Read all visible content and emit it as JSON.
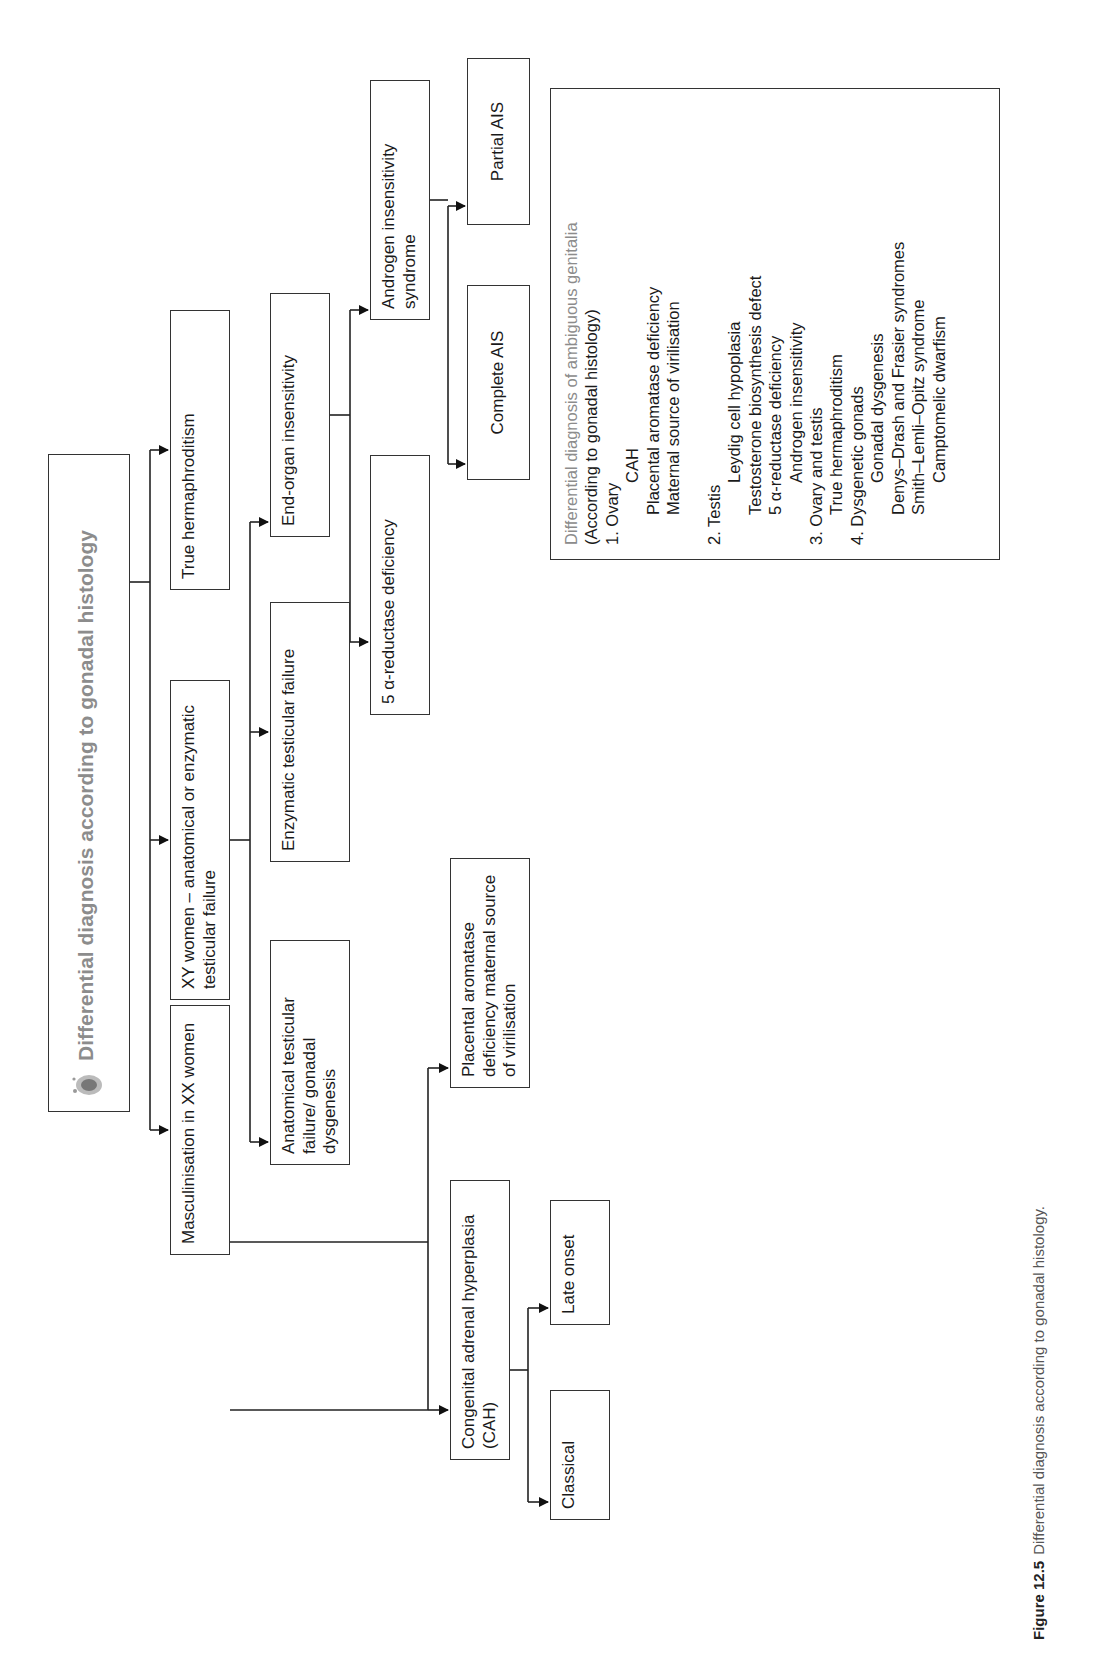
{
  "diagram": {
    "root": {
      "title": "Differential diagnosis according to gonadal histology",
      "icon": "fetus-icon"
    },
    "level1": [
      {
        "id": "masc-xx",
        "label": "Masculinisation in XX women"
      },
      {
        "id": "xy-women",
        "label": "XY women – anatomical or enzymatic testicular failure"
      },
      {
        "id": "true-herm",
        "label": "True hermaphroditism"
      }
    ],
    "xy_children": [
      {
        "id": "anatomical",
        "label": "Anatomical testicular failure/ gonadal dysgenesis"
      },
      {
        "id": "enzymatic",
        "label": "Enzymatic testicular failure"
      },
      {
        "id": "end-organ",
        "label": "End-organ insensitivity"
      }
    ],
    "end_organ_children": [
      {
        "id": "five-alpha",
        "label": "5 α-reductase deficiency"
      },
      {
        "id": "ais",
        "label": "Androgen insensitivity syndrome"
      }
    ],
    "ais_children": [
      {
        "id": "complete-ais",
        "label": "Complete AIS"
      },
      {
        "id": "partial-ais",
        "label": "Partial AIS"
      }
    ],
    "xx_children": [
      {
        "id": "cah",
        "label": "Congenital adrenal hyperplasia (CAH)"
      },
      {
        "id": "placental",
        "label": "Placental aromatase deficiency maternal source of virilisation"
      }
    ],
    "cah_children": [
      {
        "id": "classical",
        "label": "Classical"
      },
      {
        "id": "late-onset",
        "label": "Late onset"
      }
    ]
  },
  "legend": {
    "title": "Differential diagnosis of ambiguous genitalia",
    "subtitle": "(According to gonadal histology)",
    "groups": [
      {
        "heading": "1. Ovary",
        "items": [
          "CAH",
          "Placental aromatase deficiency",
          "Maternal source of virilisation"
        ]
      },
      {
        "heading": "2. Testis",
        "items": [
          "Leydig cell hypoplasia",
          "Testosterone biosynthesis defect",
          "5 α-reductase deficiency",
          "Androgen insensitivity"
        ]
      },
      {
        "heading": "3. Ovary and testis",
        "items": [
          "True hermaphroditism"
        ]
      },
      {
        "heading": "4. Dysgenetic gonads",
        "items": [
          "Gonadal dysgenesis",
          "Denys–Drash and Frasier syndromes",
          "Smith–Lemli–Opitz syndrome",
          "Camptomelic dwarfism"
        ]
      }
    ]
  },
  "caption": {
    "label": "Figure 12.5",
    "text": "Differential diagnosis according to gonadal histology."
  }
}
